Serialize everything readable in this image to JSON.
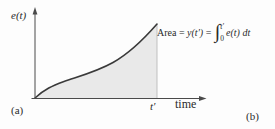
{
  "figure": {
    "y_axis_label": "e(t)",
    "x_axis_label": "time",
    "t_prime_label": "t′",
    "panel_label_a": "(a)",
    "panel_label_b": "(b)",
    "formula": {
      "prefix": "Area = ",
      "y_term": "y(t′)",
      "equals": " = ",
      "integral_sign": "∫",
      "upper_limit": "t′",
      "lower_limit": "0",
      "integrand": "e(t) dt"
    },
    "curve_points": [
      [
        35,
        98
      ],
      [
        62,
        82
      ],
      [
        95,
        71
      ],
      [
        118,
        61
      ],
      [
        135,
        48
      ],
      [
        157,
        24
      ]
    ],
    "colors": {
      "curve": "#3a3a3a",
      "axis": "#4a4a4a",
      "shade": "#e9e9e9",
      "marker_line": "#b3b3b3",
      "text": "#2b2b2b",
      "background": "#fdfdfd"
    }
  }
}
